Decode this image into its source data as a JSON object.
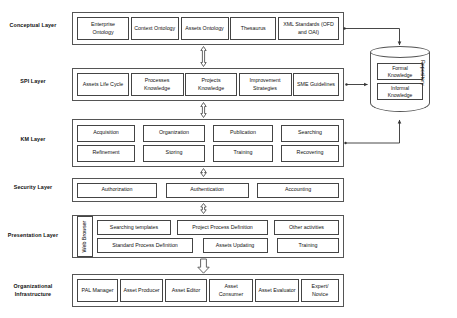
{
  "diagram": {
    "repository": {
      "label": "Repository",
      "cells": [
        {
          "label": "Formal Knowledge"
        },
        {
          "label": "Informal Knowledge"
        }
      ]
    },
    "layers": [
      {
        "id": "conceptual",
        "label": "Conceptual Layer",
        "rows": [
          [
            {
              "label": "Enterprise Ontology"
            },
            {
              "label": "Context Ontology"
            },
            {
              "label": "Assets Ontology"
            },
            {
              "label": "Thesaurus"
            },
            {
              "label": "XML Standards (OFD and OAI)"
            }
          ]
        ]
      },
      {
        "id": "spi",
        "label": "SPI Layer",
        "rows": [
          [
            {
              "label": "Assets Life Cycle"
            },
            {
              "label": "Processes Knowledge"
            },
            {
              "label": "Projects Knowledge"
            },
            {
              "label": "Improvement Strategies"
            },
            {
              "label": "SME Guidelines"
            }
          ]
        ]
      },
      {
        "id": "km",
        "label": "KM Layer",
        "rows": [
          [
            {
              "label": "Acquisition"
            },
            {
              "label": "Organization"
            },
            {
              "label": "Publication"
            },
            {
              "label": "Searching"
            }
          ],
          [
            {
              "label": "Refinement"
            },
            {
              "label": "Storing"
            },
            {
              "label": "Training"
            },
            {
              "label": "Recovering"
            }
          ]
        ]
      },
      {
        "id": "security",
        "label": "Security Layer",
        "rows": [
          [
            {
              "label": "Authorization"
            },
            {
              "label": "Authentication"
            },
            {
              "label": "Accounting"
            }
          ]
        ]
      },
      {
        "id": "presentation",
        "label": "Presentation Layer",
        "browser": {
          "label": "Web Browser"
        },
        "rows": [
          [
            {
              "label": "Searching templates"
            },
            {
              "label": "Project Process Definition"
            },
            {
              "label": "Other activities"
            }
          ],
          [
            {
              "label": "Standard Process Definition"
            },
            {
              "label": "Assets Updating"
            },
            {
              "label": "Training"
            }
          ]
        ]
      },
      {
        "id": "organizational",
        "label": "Organizational Infrastructure",
        "rows": [
          [
            {
              "label": "PAL Manager"
            },
            {
              "label": "Asset Producer"
            },
            {
              "label": "Asset Editor"
            },
            {
              "label": "Asset Consumer"
            },
            {
              "label": "Asset Evaluator"
            },
            {
              "label": "Expert/ Novice"
            }
          ]
        ]
      }
    ]
  }
}
